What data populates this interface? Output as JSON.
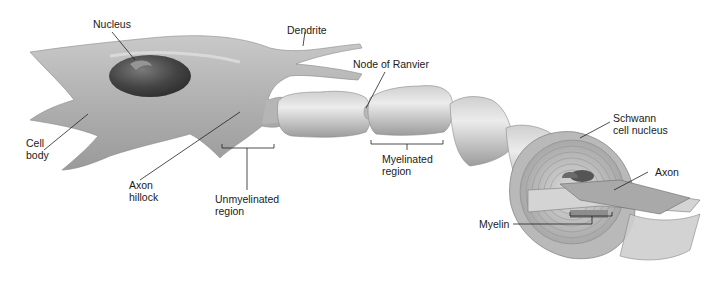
{
  "diagram": {
    "labels": {
      "nucleus": "Nucleus",
      "dendrite": "Dendrite",
      "node_of_ranvier": "Node of Ranvier",
      "cell_body_1": "Cell",
      "cell_body_2": "body",
      "axon_hillock_1": "Axon",
      "axon_hillock_2": "hillock",
      "unmyelinated_1": "Unmyelinated",
      "unmyelinated_2": "region",
      "myelinated_1": "Myelinated",
      "myelinated_2": "region",
      "schwann_1": "Schwann",
      "schwann_2": "cell nucleus",
      "axon": "Axon",
      "myelin": "Myelin"
    },
    "colors": {
      "cell_light": "#d9d9d9",
      "cell_mid": "#b3b3b3",
      "cell_dark": "#8c8c8c",
      "nucleus": "#4a4a4a",
      "line": "#222222"
    }
  }
}
